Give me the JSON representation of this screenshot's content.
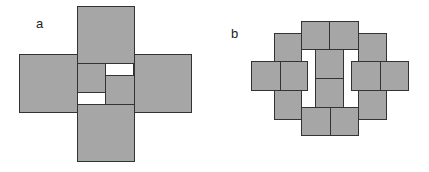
{
  "figure_a": {
    "label": "a",
    "tile_color": "#a6a6a6",
    "tiles": [
      {
        "name": "top-square",
        "x": 77,
        "y": 6,
        "w": 58,
        "h": 58
      },
      {
        "name": "left-square",
        "x": 19,
        "y": 54,
        "w": 59,
        "h": 59
      },
      {
        "name": "right-square",
        "x": 134,
        "y": 54,
        "w": 58,
        "h": 59
      },
      {
        "name": "bottom-square",
        "x": 77,
        "y": 104,
        "w": 58,
        "h": 58
      },
      {
        "name": "center-upper-left-square",
        "x": 77,
        "y": 63,
        "w": 29,
        "h": 30
      },
      {
        "name": "center-lower-right-square",
        "x": 105,
        "y": 75,
        "w": 30,
        "h": 30
      }
    ],
    "gaps": [
      {
        "name": "center-upper-right-gap",
        "x": 105,
        "y": 63,
        "w": 29,
        "h": 13
      },
      {
        "name": "center-lower-left-gap",
        "x": 77,
        "y": 92,
        "w": 29,
        "h": 13
      }
    ]
  },
  "figure_b": {
    "label": "b",
    "tile_color": "#a6a6a6",
    "tiles": [
      {
        "name": "left-column-back",
        "x": 274,
        "y": 33,
        "w": 28,
        "h": 87
      },
      {
        "name": "right-column-back",
        "x": 358,
        "y": 33,
        "w": 29,
        "h": 87
      },
      {
        "name": "top-left-square",
        "x": 301,
        "y": 21,
        "w": 29,
        "h": 29
      },
      {
        "name": "top-right-square",
        "x": 329,
        "y": 21,
        "w": 30,
        "h": 29
      },
      {
        "name": "bottom-left-square",
        "x": 301,
        "y": 107,
        "w": 30,
        "h": 29
      },
      {
        "name": "bottom-right-square",
        "x": 330,
        "y": 107,
        "w": 29,
        "h": 29
      },
      {
        "name": "center-upper-square",
        "x": 315,
        "y": 49,
        "w": 29,
        "h": 30
      },
      {
        "name": "center-lower-square",
        "x": 315,
        "y": 78,
        "w": 29,
        "h": 30
      },
      {
        "name": "left-outer-square",
        "x": 251,
        "y": 61,
        "w": 30,
        "h": 30
      },
      {
        "name": "left-inner-square",
        "x": 280,
        "y": 61,
        "w": 28,
        "h": 30
      },
      {
        "name": "right-inner-square",
        "x": 351,
        "y": 61,
        "w": 30,
        "h": 30
      },
      {
        "name": "right-outer-square",
        "x": 380,
        "y": 61,
        "w": 29,
        "h": 30
      }
    ],
    "gaps": []
  }
}
